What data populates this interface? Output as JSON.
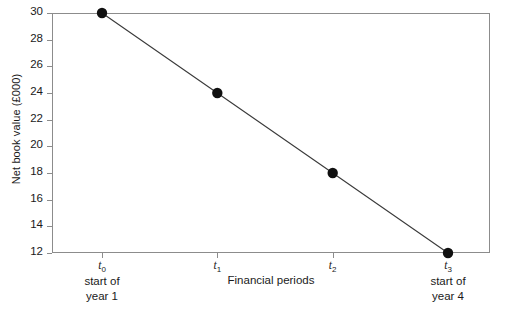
{
  "chart_data": {
    "type": "line",
    "title": "",
    "xlabel": "Financial periods",
    "ylabel": "Net book value (£000)",
    "x": [
      "t0",
      "t1",
      "t2",
      "t3"
    ],
    "x_tick_labels": [
      "t",
      "t",
      "t",
      "t"
    ],
    "x_tick_subscripts": [
      "0",
      "1",
      "2",
      "3"
    ],
    "x_tick_descriptions": [
      "start of\nyear 1",
      "",
      "",
      "start of\nyear 4"
    ],
    "values": [
      30,
      24,
      18,
      12
    ],
    "series": [
      {
        "name": "Net book value",
        "values": [
          30,
          24,
          18,
          12
        ]
      }
    ],
    "ylim": [
      12,
      30
    ],
    "y_ticks": [
      12,
      14,
      16,
      18,
      20,
      22,
      24,
      26,
      28,
      30
    ],
    "y_tick_labels": [
      "12",
      "14",
      "16",
      "18",
      "20",
      "22",
      "24",
      "26",
      "28",
      "30"
    ],
    "grid": false,
    "legend": "none",
    "marker": "filled-circle",
    "marker_color": "#101010",
    "line_color": "#3a3a3a",
    "axis_color": "#8c8c8c",
    "background_color": "#ffffff"
  },
  "axes": {
    "y_title": "Net book value (£000)",
    "x_title": "Financial periods"
  }
}
